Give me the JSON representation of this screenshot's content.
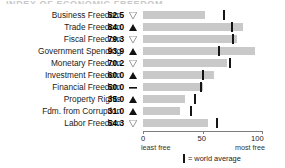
{
  "title_sliver": "INDEX OF ECONOMIC FREEDOM",
  "colors": {
    "bar": "#c9c9c9",
    "average_tick": "#151515",
    "axis": "#7d7d7d",
    "text": "#1b1b1b"
  },
  "axis": {
    "ticks": [
      "0",
      "50",
      "100"
    ],
    "tick_values": [
      0,
      50,
      100
    ],
    "left_caption": "least free",
    "right_caption": "most free",
    "min": 0,
    "max": 100
  },
  "legend": {
    "marker": "world-average-tick",
    "text": "= world average"
  },
  "markers": {
    "up": "up-triangle-filled",
    "down": "down-triangle-hollow",
    "flat": "dash"
  },
  "chart_data": {
    "type": "bar",
    "title": "INDEX OF ECONOMIC FREEDOM",
    "xlabel": "",
    "ylabel": "",
    "xlim": [
      0,
      100
    ],
    "grid": false,
    "orientation": "horizontal",
    "legend": "= world average",
    "categories": [
      "Business Freedom",
      "Trade Freedom",
      "Fiscal Freedom",
      "Government Spending",
      "Monetary Freedom",
      "Investment Freedom",
      "Financial Freedom",
      "Property Rights",
      "Fdm. from Corruption",
      "Labor Freedom"
    ],
    "values": [
      52.5,
      84.0,
      79.3,
      93.9,
      70.2,
      60.0,
      50.0,
      35.0,
      31.0,
      54.3
    ],
    "value_labels": [
      "52.5",
      "84.0",
      "79.3",
      "93.9",
      "70.2",
      "60.0",
      "50.0",
      "35.0",
      "31.0",
      "54.3"
    ],
    "trends": [
      "down",
      "up",
      "down",
      "up",
      "down",
      "up",
      "flat",
      "up",
      "up",
      "down"
    ],
    "world_average": [
      68.0,
      74.5,
      76.0,
      63.5,
      73.0,
      50.0,
      48.5,
      43.5,
      40.5,
      62.0
    ],
    "series": [
      {
        "name": "country score",
        "values": [
          52.5,
          84.0,
          79.3,
          93.9,
          70.2,
          60.0,
          50.0,
          35.0,
          31.0,
          54.3
        ]
      },
      {
        "name": "world average",
        "values": [
          68.0,
          74.5,
          76.0,
          63.5,
          73.0,
          50.0,
          48.5,
          43.5,
          40.5,
          62.0
        ]
      }
    ]
  }
}
